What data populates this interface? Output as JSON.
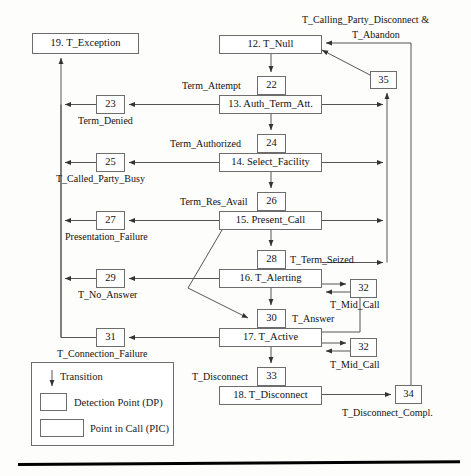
{
  "diagram": {
    "nodes": {
      "exception": "19. T_Exception",
      "null": "12. T_Null",
      "auth_term_att": "13. Auth_Term_Att.",
      "select_facility": "14. Select_Facility",
      "present_call": "15. Present_Call",
      "alerting": "16. T_Alerting",
      "active": "17. T_Active",
      "disconnect": "18. T_Disconnect"
    },
    "detection_points": {
      "dp22": "22",
      "dp23": "23",
      "dp24": "24",
      "dp25": "25",
      "dp26": "26",
      "dp27": "27",
      "dp28": "28",
      "dp29": "29",
      "dp30": "30",
      "dp31": "31",
      "dp32a": "32",
      "dp32b": "32",
      "dp33": "33",
      "dp34": "34",
      "dp35": "35"
    },
    "labels": {
      "calling_party_disconnect": "T_Calling_Party_Disconnect &",
      "abandon": "T_Abandon",
      "term_attempt": "Term_Attempt",
      "term_denied": "Term_Denied",
      "term_authorized": "Term_Authorized",
      "called_party_busy": "T_Called_Party_Busy",
      "term_res_avail": "Term_Res_Avail",
      "presentation_failure": "Presentation_Failure",
      "term_seized": "T_Term_Seized",
      "no_answer": "T_No_Answer",
      "mid_call_upper": "T_Mid_Call",
      "answer": "T_Answer",
      "connection_failure": "T_Connection_Failure",
      "mid_call_lower": "T_Mid_Call",
      "disconnect": "T_Disconnect",
      "disconnect_compl": "T_Disconnect_Compl."
    },
    "legend": {
      "transition": "Transition",
      "detection_point": "Detection Point (DP)",
      "point_in_call": "Point in Call (PIC)"
    },
    "colors": {
      "stroke": "#6d6d6d",
      "line": "#555555",
      "text": "#111111",
      "background": "#fdfdfb"
    }
  }
}
